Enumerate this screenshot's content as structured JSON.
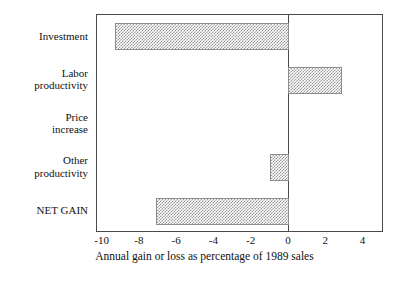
{
  "chart_data": {
    "type": "bar",
    "orientation": "horizontal",
    "title": "",
    "subtitle": "",
    "xlabel": "Annual gain or loss as percentage of 1989 sales",
    "ylabel": "",
    "categories": [
      "Investment",
      "Labor productivity",
      "Price increase",
      "Other productivity",
      "NET GAIN"
    ],
    "category_lines": [
      [
        "Investment"
      ],
      [
        "Labor",
        "productivity"
      ],
      [
        "Price",
        "increase"
      ],
      [
        "Other",
        "productivity"
      ],
      [
        "NET GAIN"
      ]
    ],
    "values": [
      -9.3,
      2.85,
      0,
      -0.95,
      -7.1
    ],
    "xlim": [
      -10.3,
      5.1
    ],
    "xticks": [
      -10,
      -8,
      -6,
      -4,
      -2,
      0,
      2,
      4
    ],
    "xtick_labels": [
      "-10",
      "-8",
      "-6",
      "-4",
      "-2",
      "0",
      "2",
      "4"
    ],
    "grid": false,
    "legend": null,
    "zero_reference_line": 0,
    "bar_fill": "#9a9a9a",
    "bar_edge": "#8d8d8d",
    "frame_color": "#4a4a4a",
    "background": "#ffffff"
  },
  "axis": {
    "title": "Annual gain or loss as percentage of 1989 sales"
  }
}
